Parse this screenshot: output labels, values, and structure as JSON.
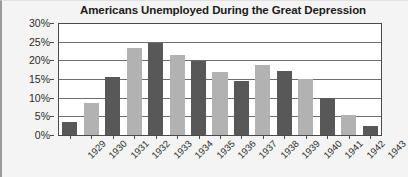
{
  "chart_data": {
    "type": "bar",
    "title": "Americans Unemployed During the Great Depression",
    "xlabel": "",
    "ylabel": "",
    "ylim": [
      0,
      30
    ],
    "ytick_labels": [
      "30%",
      "25%",
      "20%",
      "15%",
      "10%",
      "5%",
      "0%"
    ],
    "ytick_values": [
      30,
      25,
      20,
      15,
      10,
      5,
      0
    ],
    "grid": true,
    "legend": false,
    "unit": "%",
    "categories": [
      "1929",
      "1930",
      "1931",
      "1932",
      "1933",
      "1934",
      "1935",
      "1936",
      "1937",
      "1938",
      "1939",
      "1940",
      "1941",
      "1942",
      "1943"
    ],
    "values": [
      3.5,
      8.7,
      15.7,
      23.6,
      25.0,
      21.6,
      20.0,
      17.0,
      14.6,
      19.0,
      17.4,
      15.1,
      10.0,
      5.4,
      2.4
    ],
    "bar_colors": [
      "#585858",
      "#b2b2b2",
      "#585858",
      "#b2b2b2",
      "#585858",
      "#b2b2b2",
      "#585858",
      "#b2b2b2",
      "#585858",
      "#b2b2b2",
      "#585858",
      "#b2b2b2",
      "#585858",
      "#b2b2b2",
      "#585858"
    ],
    "colors": {
      "dark_bar": "#585858",
      "light_bar": "#b2b2b2",
      "plot_background": "#ffffff",
      "page_background": "#f4f4f4",
      "axis": "#4a4a4a",
      "gridline": "#6e6e6e",
      "title_text": "#1b1b1b",
      "tick_text": "#2a2a2a"
    }
  }
}
